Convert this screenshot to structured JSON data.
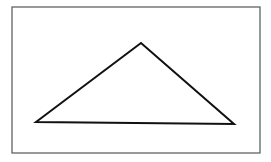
{
  "diagram": {
    "type": "triangle",
    "frame": {
      "x": 12,
      "y": 7,
      "width": 248,
      "height": 146,
      "stroke": "#555555"
    },
    "triangle": {
      "points": [
        [
          36,
          122
        ],
        [
          141,
          43
        ],
        [
          234,
          124
        ]
      ],
      "stroke": "#111111",
      "fill": "none"
    }
  }
}
